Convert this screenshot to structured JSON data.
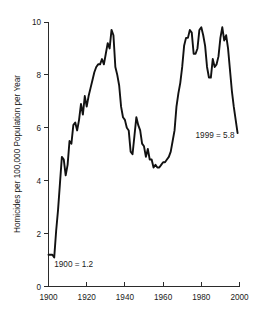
{
  "chart_data": {
    "type": "line",
    "title": "",
    "xlabel": "",
    "ylabel": "Homicides per 100,000 Population per Year",
    "xlim": [
      1900,
      2000
    ],
    "ylim": [
      0,
      10
    ],
    "grid": false,
    "legend": "none",
    "xticks": [
      "1900",
      "1920",
      "1940",
      "1960",
      "1980",
      "2000"
    ],
    "xtick_values": [
      1900,
      1920,
      1940,
      1960,
      1980,
      2000
    ],
    "yticks": [
      "0",
      "2",
      "4",
      "6",
      "8",
      "10"
    ],
    "ytick_values": [
      0,
      2,
      4,
      6,
      8,
      10
    ],
    "annotations": [
      {
        "text": "1900 = 1.2",
        "x": 1903,
        "y": 0.75
      },
      {
        "text": "1999 = 5.8",
        "x": 1977,
        "y": 5.6
      }
    ],
    "series": [
      {
        "name": "Homicide rate",
        "color": "#111111",
        "x": [
          1900,
          1901,
          1902,
          1903,
          1904,
          1905,
          1906,
          1907,
          1908,
          1909,
          1910,
          1911,
          1912,
          1913,
          1914,
          1915,
          1916,
          1917,
          1918,
          1919,
          1920,
          1921,
          1922,
          1923,
          1924,
          1925,
          1926,
          1927,
          1928,
          1929,
          1930,
          1931,
          1932,
          1933,
          1934,
          1935,
          1936,
          1937,
          1938,
          1939,
          1940,
          1941,
          1942,
          1943,
          1944,
          1945,
          1946,
          1947,
          1948,
          1949,
          1950,
          1951,
          1952,
          1953,
          1954,
          1955,
          1956,
          1957,
          1958,
          1959,
          1960,
          1961,
          1962,
          1963,
          1964,
          1965,
          1966,
          1967,
          1968,
          1969,
          1970,
          1971,
          1972,
          1973,
          1974,
          1975,
          1976,
          1977,
          1978,
          1979,
          1980,
          1981,
          1982,
          1983,
          1984,
          1985,
          1986,
          1987,
          1988,
          1989,
          1990,
          1991,
          1992,
          1993,
          1994,
          1995,
          1996,
          1997,
          1998,
          1999
        ],
        "values": [
          1.2,
          1.2,
          1.2,
          1.1,
          2.1,
          2.9,
          3.9,
          4.9,
          4.8,
          4.2,
          4.6,
          5.5,
          5.4,
          6.1,
          6.2,
          5.9,
          6.3,
          6.9,
          6.5,
          7.2,
          6.8,
          7.2,
          7.5,
          7.8,
          8.1,
          8.3,
          8.4,
          8.4,
          8.6,
          8.4,
          8.8,
          9.2,
          9.0,
          9.7,
          9.5,
          8.3,
          8.0,
          7.6,
          6.8,
          6.4,
          6.3,
          6.0,
          5.9,
          5.1,
          5.0,
          5.7,
          6.4,
          6.1,
          5.9,
          5.4,
          5.3,
          4.9,
          5.2,
          4.8,
          4.8,
          4.5,
          4.6,
          4.5,
          4.5,
          4.6,
          4.7,
          4.7,
          4.8,
          4.9,
          5.1,
          5.5,
          5.9,
          6.8,
          7.3,
          7.7,
          8.3,
          9.1,
          9.4,
          9.4,
          9.7,
          9.6,
          8.8,
          8.8,
          9.0,
          9.7,
          9.8,
          9.5,
          9.1,
          8.3,
          7.9,
          7.9,
          8.6,
          8.3,
          8.4,
          8.7,
          9.4,
          9.8,
          9.3,
          9.5,
          9.0,
          8.2,
          7.4,
          6.8,
          6.3,
          5.8
        ]
      }
    ]
  }
}
